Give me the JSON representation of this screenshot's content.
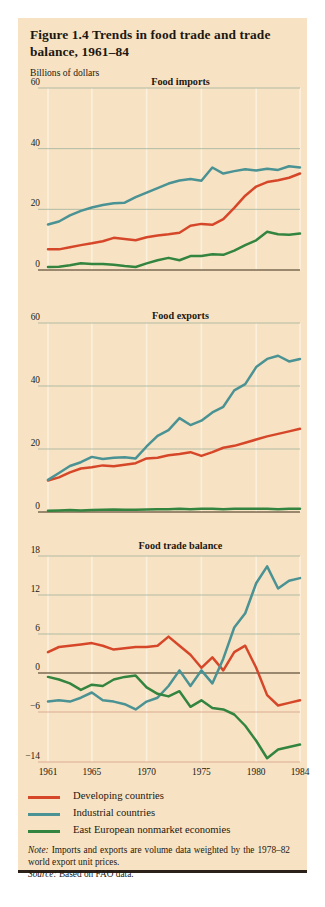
{
  "figure": {
    "title": "Figure 1.4  Trends in food trade and trade balance, 1961–84",
    "axis_unit_label": "Billions of dollars",
    "note_label": "Note:",
    "note_text": "Imports and exports are volume data weighted by the 1978–82 world export unit prices.",
    "source_label": "Source:",
    "source_text": "Based on FAO data.",
    "background_color": "#f7e3c3",
    "rule_color": "#2b2118"
  },
  "legend": {
    "position": "bottom-left",
    "items": [
      {
        "label": "Developing countries",
        "color": "#d6472a"
      },
      {
        "label": "Industrial countries",
        "color": "#4a9293"
      },
      {
        "label": "East European nonmarket economies",
        "color": "#33843f"
      }
    ]
  },
  "chart_data": [
    {
      "type": "line",
      "title": "Food imports",
      "xlabel": "",
      "ylabel": "Billions of dollars",
      "x": [
        1961,
        1962,
        1963,
        1964,
        1965,
        1966,
        1967,
        1968,
        1969,
        1970,
        1971,
        1972,
        1973,
        1974,
        1975,
        1976,
        1977,
        1978,
        1979,
        1980,
        1981,
        1982,
        1983,
        1984
      ],
      "xlim": [
        1961,
        1984
      ],
      "ylim": [
        0,
        60
      ],
      "yticks": [
        0,
        20,
        40,
        60
      ],
      "xticks": [
        1961,
        1965,
        1970,
        1975,
        1980,
        1984
      ],
      "grid": true,
      "series": [
        {
          "name": "Developing countries",
          "color": "#d6472a",
          "values": [
            6.8,
            6.8,
            7.5,
            8.2,
            8.8,
            9.5,
            10.6,
            10.2,
            9.8,
            10.8,
            11.4,
            11.8,
            12.3,
            14.6,
            15.2,
            14.9,
            16.8,
            20.5,
            24.5,
            27.5,
            29.0,
            29.6,
            30.4,
            31.8
          ]
        },
        {
          "name": "Industrial countries",
          "color": "#4a9293",
          "values": [
            15.0,
            16.0,
            18.0,
            19.5,
            20.6,
            21.4,
            22.0,
            22.2,
            24.0,
            25.5,
            27.0,
            28.5,
            29.5,
            30.0,
            29.4,
            33.8,
            31.8,
            32.6,
            33.2,
            32.8,
            33.4,
            33.0,
            34.2,
            33.8
          ]
        },
        {
          "name": "East European nonmarket economies",
          "color": "#33843f",
          "values": [
            1.0,
            1.1,
            1.6,
            2.2,
            2.0,
            2.0,
            1.7,
            1.3,
            1.0,
            2.2,
            3.2,
            4.0,
            3.2,
            4.6,
            4.6,
            5.2,
            5.0,
            6.4,
            8.2,
            9.8,
            12.6,
            11.8,
            11.6,
            12.0
          ]
        }
      ]
    },
    {
      "type": "line",
      "title": "Food exports",
      "xlabel": "",
      "ylabel": "Billions of dollars",
      "x": [
        1961,
        1962,
        1963,
        1964,
        1965,
        1966,
        1967,
        1968,
        1969,
        1970,
        1971,
        1972,
        1973,
        1974,
        1975,
        1976,
        1977,
        1978,
        1979,
        1980,
        1981,
        1982,
        1983,
        1984
      ],
      "xlim": [
        1961,
        1984
      ],
      "ylim": [
        0,
        60
      ],
      "yticks": [
        0,
        20,
        40,
        60
      ],
      "xticks": [
        1961,
        1965,
        1970,
        1975,
        1980,
        1984
      ],
      "grid": true,
      "series": [
        {
          "name": "Developing countries",
          "color": "#d6472a",
          "values": [
            10.0,
            11.0,
            12.6,
            13.8,
            14.2,
            14.8,
            14.5,
            15.0,
            15.5,
            17.0,
            17.2,
            18.0,
            18.4,
            19.0,
            17.8,
            19.0,
            20.4,
            21.0,
            22.0,
            23.0,
            24.0,
            24.8,
            25.6,
            26.4
          ]
        },
        {
          "name": "Industrial countries",
          "color": "#4a9293",
          "values": [
            10.2,
            12.4,
            14.6,
            15.8,
            17.5,
            16.8,
            17.2,
            17.4,
            17.0,
            20.8,
            24.2,
            26.0,
            29.8,
            27.6,
            29.0,
            31.6,
            33.4,
            38.6,
            40.6,
            46.0,
            48.6,
            49.6,
            47.8,
            48.6
          ]
        },
        {
          "name": "East European nonmarket economies",
          "color": "#33843f",
          "values": [
            0.4,
            0.5,
            0.6,
            0.5,
            0.6,
            0.7,
            0.8,
            0.7,
            0.7,
            0.8,
            0.9,
            0.9,
            1.0,
            0.9,
            1.0,
            1.0,
            0.9,
            1.0,
            1.0,
            1.0,
            1.0,
            0.9,
            1.0,
            1.0
          ]
        }
      ]
    },
    {
      "type": "line",
      "title": "Food trade balance",
      "xlabel": "",
      "ylabel": "Billions of dollars",
      "x": [
        1961,
        1962,
        1963,
        1964,
        1965,
        1966,
        1967,
        1968,
        1969,
        1970,
        1971,
        1972,
        1973,
        1974,
        1975,
        1976,
        1977,
        1978,
        1979,
        1980,
        1981,
        1982,
        1983,
        1984
      ],
      "xlim": [
        1961,
        1984
      ],
      "ylim": [
        -14,
        18
      ],
      "yticks": [
        -14,
        -6,
        0,
        6,
        12,
        18
      ],
      "xticks": [
        1961,
        1965,
        1970,
        1975,
        1980,
        1984
      ],
      "grid": true,
      "series": [
        {
          "name": "Developing countries",
          "color": "#d6472a",
          "values": [
            3.2,
            4.0,
            4.2,
            4.4,
            4.6,
            4.2,
            3.6,
            3.8,
            4.0,
            4.0,
            4.2,
            5.6,
            4.2,
            2.8,
            0.8,
            2.4,
            0.4,
            3.2,
            4.2,
            0.8,
            -3.4,
            -5.0,
            -4.6,
            -4.2
          ]
        },
        {
          "name": "Industrial countries",
          "color": "#4a9293",
          "values": [
            -4.4,
            -4.2,
            -4.4,
            -3.8,
            -3.0,
            -4.2,
            -4.4,
            -4.8,
            -5.6,
            -4.4,
            -3.8,
            -2.0,
            0.4,
            -2.0,
            0.4,
            -1.6,
            2.2,
            7.0,
            9.2,
            13.8,
            16.4,
            13.0,
            14.2,
            14.6
          ]
        },
        {
          "name": "East European nonmarket economies",
          "color": "#33843f",
          "values": [
            -0.6,
            -1.0,
            -1.6,
            -2.6,
            -1.8,
            -2.0,
            -1.0,
            -0.6,
            -0.4,
            -2.2,
            -3.2,
            -3.6,
            -2.8,
            -5.2,
            -4.2,
            -5.4,
            -5.6,
            -6.4,
            -8.2,
            -10.6,
            -13.4,
            -12.0,
            -11.6,
            -11.2
          ]
        }
      ]
    }
  ]
}
